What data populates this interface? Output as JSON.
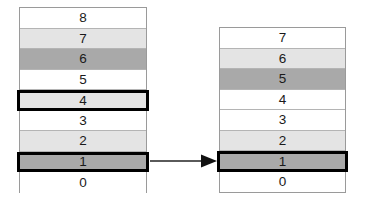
{
  "diagram": {
    "title_visible": false,
    "type": "stack-transition",
    "colors": {
      "white": "#ffffff",
      "light_gray": "#e4e4e4",
      "dark_gray": "#a9a9a9",
      "outline": "#000000",
      "cell_border": "#b4b4b4",
      "container_border": "#9a9a9a",
      "arrow": "#5a5a5a"
    },
    "before": {
      "name": "left-stack",
      "cells": [
        {
          "label": "8",
          "fill": "white",
          "highlighted": false
        },
        {
          "label": "7",
          "fill": "light_gray",
          "highlighted": false
        },
        {
          "label": "6",
          "fill": "dark_gray",
          "highlighted": false
        },
        {
          "label": "5",
          "fill": "white",
          "highlighted": false
        },
        {
          "label": "4",
          "fill": "light_gray",
          "highlighted": true
        },
        {
          "label": "3",
          "fill": "white",
          "highlighted": false
        },
        {
          "label": "2",
          "fill": "light_gray",
          "highlighted": false
        },
        {
          "label": "1",
          "fill": "dark_gray",
          "highlighted": true
        },
        {
          "label": "0",
          "fill": "white",
          "highlighted": false
        }
      ]
    },
    "after": {
      "name": "right-stack",
      "cells": [
        {
          "label": "7",
          "fill": "white",
          "highlighted": false
        },
        {
          "label": "6",
          "fill": "light_gray",
          "highlighted": false
        },
        {
          "label": "5",
          "fill": "dark_gray",
          "highlighted": false
        },
        {
          "label": "4",
          "fill": "white",
          "highlighted": false
        },
        {
          "label": "3",
          "fill": "white",
          "highlighted": false
        },
        {
          "label": "2",
          "fill": "light_gray",
          "highlighted": false
        },
        {
          "label": "1",
          "fill": "dark_gray",
          "highlighted": true
        },
        {
          "label": "0",
          "fill": "white",
          "highlighted": false
        }
      ]
    },
    "arrow": {
      "name": "transition-arrow",
      "direction": "right",
      "icon": "arrow-right-icon"
    }
  }
}
